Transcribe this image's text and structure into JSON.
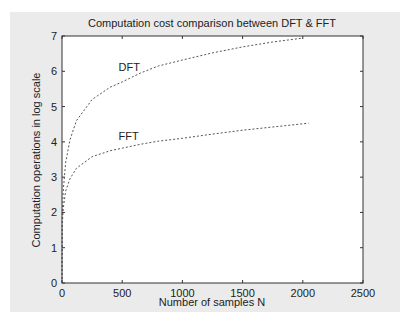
{
  "chart_data": {
    "type": "line",
    "title": "Computation cost comparison between DFT & FFT",
    "xlabel": "Number of samples N",
    "ylabel": "Computation operations in log scale",
    "xlim": [
      0,
      2500
    ],
    "ylim": [
      0,
      7
    ],
    "xticks": [
      0,
      500,
      1000,
      1500,
      2000,
      2500
    ],
    "yticks": [
      0,
      1,
      2,
      3,
      4,
      5,
      6,
      7
    ],
    "grid": false,
    "legend": null,
    "line_style": "dashed",
    "series": [
      {
        "name": "DFT",
        "x": [
          2,
          10,
          30,
          66,
          120,
          250,
          400,
          500,
          650,
          800,
          1000,
          1250,
          1500,
          1750,
          2000
        ],
        "y": [
          1.9,
          2.6,
          3.4,
          4.05,
          4.6,
          5.2,
          5.55,
          5.7,
          5.95,
          6.15,
          6.32,
          6.52,
          6.69,
          6.83,
          6.94
        ]
      },
      {
        "name": "FFT",
        "x": [
          2,
          10,
          30,
          66,
          120,
          250,
          400,
          500,
          650,
          800,
          1000,
          1250,
          1500,
          1750,
          2048
        ],
        "y": [
          1.6,
          2.1,
          2.6,
          2.95,
          3.25,
          3.58,
          3.75,
          3.82,
          3.93,
          4.02,
          4.1,
          4.22,
          4.33,
          4.42,
          4.53
        ]
      }
    ],
    "annotations": [
      {
        "text": "DFT",
        "x": 470,
        "y": 6.0
      },
      {
        "text": "FFT",
        "x": 470,
        "y": 4.05
      }
    ]
  }
}
